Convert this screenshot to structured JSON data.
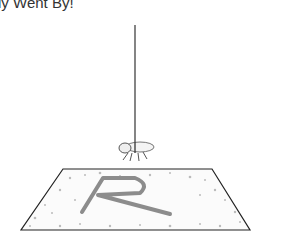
{
  "title": "ly Went By!",
  "scene": {
    "string_color": "#333333",
    "fly_color": "#555555",
    "mat_outline": "#222222",
    "mat_letter": "R",
    "letter_color": "#8c8c8c",
    "speckle_color": "#b5b5b5"
  }
}
